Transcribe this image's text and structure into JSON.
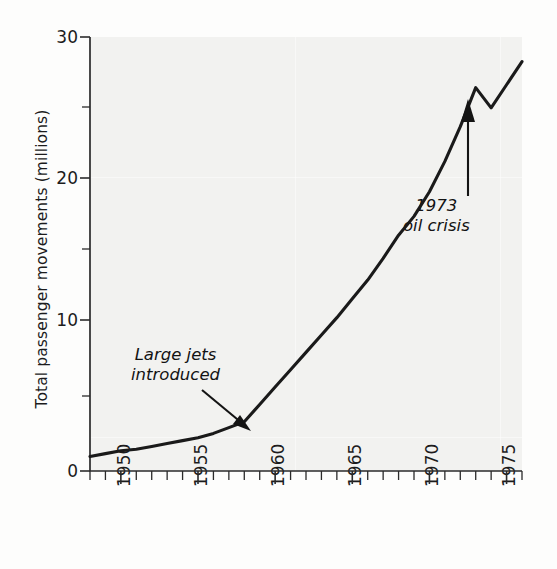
{
  "chart_data": {
    "type": "line",
    "title": "",
    "xlabel": "",
    "ylabel": "Total passenger movements (millions)",
    "xlim": [
      1948,
      1976
    ],
    "ylim": [
      0,
      30
    ],
    "grid": false,
    "legend": "none",
    "y_ticks_major": [
      0,
      10,
      20,
      30
    ],
    "y_ticks_minor": [
      5,
      15,
      25
    ],
    "y_tick_labels": [
      "0",
      "10",
      "20",
      "30"
    ],
    "x_tick_labels": [
      "1950",
      "1955",
      "1960",
      "1965",
      "1970",
      "1975"
    ],
    "x_tick_label_values": [
      1950,
      1955,
      1960,
      1965,
      1970,
      1975
    ],
    "x_minor_tick_interval": 1,
    "series": [
      {
        "name": "Total passenger movements",
        "x": [
          1948,
          1949,
          1950,
          1951,
          1952,
          1953,
          1954,
          1955,
          1956,
          1957,
          1958,
          1959,
          1960,
          1961,
          1962,
          1963,
          1964,
          1965,
          1966,
          1967,
          1968,
          1969,
          1970,
          1971,
          1972,
          1973,
          1974,
          1975,
          1976
        ],
        "values": [
          1.0,
          1.2,
          1.4,
          1.5,
          1.7,
          1.9,
          2.1,
          2.3,
          2.6,
          3.0,
          3.4,
          4.6,
          5.8,
          7.0,
          8.2,
          9.4,
          10.6,
          11.9,
          13.2,
          14.7,
          16.3,
          17.6,
          19.3,
          21.4,
          23.8,
          26.5,
          25.1,
          26.7,
          28.3
        ]
      }
    ],
    "annotations": [
      {
        "id": "large-jets",
        "line1": "Large jets",
        "line2": "introduced",
        "points_to_year": 1958,
        "points_to_value": 3.4,
        "style": "italic"
      },
      {
        "id": "oil-crisis",
        "line1": "1973",
        "line2": "oil crisis",
        "points_to_year": 1974,
        "points_to_value": 25.1,
        "style": "italic"
      }
    ],
    "colors": {
      "line": "#1a1a1a",
      "axis": "#2b2b2b",
      "text": "#1c1c1c",
      "plot_background": "#f2f2f0",
      "page_background": "#fdfdfc"
    }
  }
}
